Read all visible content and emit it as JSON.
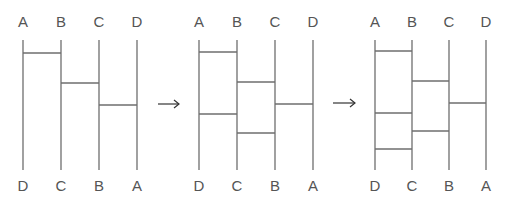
{
  "colors": {
    "line": "#6e6e6e",
    "text": "#555555",
    "arrow": "#333333"
  },
  "panels": [
    {
      "top_labels": [
        "A",
        "B",
        "C",
        "D"
      ],
      "bottom_labels": [
        "D",
        "C",
        "B",
        "A"
      ],
      "rails_x": [
        23,
        61,
        99,
        137
      ],
      "rungs": [
        {
          "between": [
            "A",
            "B"
          ],
          "y": 53
        },
        {
          "between": [
            "B",
            "C"
          ],
          "y": 83
        },
        {
          "between": [
            "C",
            "D"
          ],
          "y": 105
        }
      ]
    },
    {
      "top_labels": [
        "A",
        "B",
        "C",
        "D"
      ],
      "bottom_labels": [
        "D",
        "C",
        "B",
        "A"
      ],
      "rails_x": [
        199,
        237,
        275,
        313
      ],
      "rungs": [
        {
          "between": [
            "A",
            "B"
          ],
          "y": 52
        },
        {
          "between": [
            "B",
            "C"
          ],
          "y": 82
        },
        {
          "between": [
            "C",
            "D"
          ],
          "y": 104
        },
        {
          "between": [
            "A",
            "B"
          ],
          "y": 114
        },
        {
          "between": [
            "B",
            "C"
          ],
          "y": 133
        }
      ]
    },
    {
      "top_labels": [
        "A",
        "B",
        "C",
        "D"
      ],
      "bottom_labels": [
        "D",
        "C",
        "B",
        "A"
      ],
      "rails_x": [
        375,
        412,
        449,
        486
      ],
      "rungs": [
        {
          "between": [
            "A",
            "B"
          ],
          "y": 51
        },
        {
          "between": [
            "B",
            "C"
          ],
          "y": 81
        },
        {
          "between": [
            "C",
            "D"
          ],
          "y": 103
        },
        {
          "between": [
            "A",
            "B"
          ],
          "y": 113
        },
        {
          "between": [
            "B",
            "C"
          ],
          "y": 131
        },
        {
          "between": [
            "A",
            "B"
          ],
          "y": 149
        }
      ]
    }
  ],
  "arrows": [
    {
      "symbol": "→",
      "x1": 158,
      "x2": 179,
      "y": 104
    },
    {
      "symbol": "→",
      "x1": 333,
      "x2": 355,
      "y": 103
    }
  ]
}
